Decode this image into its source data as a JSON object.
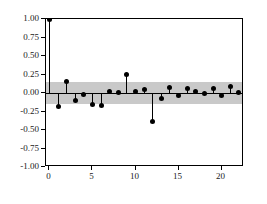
{
  "chart_data": {
    "type": "bar",
    "subtype": "stem-acf",
    "title": "",
    "subtitle": "",
    "xlabel": "",
    "ylabel": "",
    "x": [
      0,
      1,
      2,
      3,
      4,
      5,
      6,
      7,
      8,
      9,
      10,
      11,
      12,
      13,
      14,
      15,
      16,
      17,
      18,
      19,
      20,
      21,
      22
    ],
    "values": [
      1.0,
      -0.18,
      0.16,
      -0.1,
      -0.02,
      -0.15,
      -0.17,
      0.02,
      0.01,
      0.25,
      0.02,
      0.05,
      -0.39,
      -0.08,
      0.07,
      -0.03,
      0.06,
      0.02,
      -0.01,
      0.06,
      -0.04,
      0.09,
      0.01
    ],
    "categories": [
      "0",
      "1",
      "2",
      "3",
      "4",
      "5",
      "6",
      "7",
      "8",
      "9",
      "10",
      "11",
      "12",
      "13",
      "14",
      "15",
      "16",
      "17",
      "18",
      "19",
      "20",
      "21",
      "22"
    ],
    "series": [
      {
        "name": "autocorrelation",
        "values": [
          1.0,
          -0.18,
          0.16,
          -0.1,
          -0.02,
          -0.15,
          -0.17,
          0.02,
          0.01,
          0.25,
          0.02,
          0.05,
          -0.39,
          -0.08,
          0.07,
          -0.03,
          0.06,
          0.02,
          -0.01,
          0.06,
          -0.04,
          0.09,
          0.01
        ]
      }
    ],
    "xlim": [
      -0.4,
      22.6
    ],
    "ylim": [
      -1.0,
      1.0
    ],
    "yticks": [
      1.0,
      0.75,
      0.5,
      0.25,
      0.0,
      -0.25,
      -0.5,
      -0.75,
      -1.0
    ],
    "ytick_labels": [
      "1.00",
      "0.75",
      "0.50",
      "0.25",
      "0.00",
      "-0.25",
      "-0.50",
      "-0.75",
      "-1.00"
    ],
    "xticks": [
      0,
      5,
      10,
      15,
      20
    ],
    "xtick_labels": [
      "0",
      "5",
      "10",
      "15",
      "20"
    ],
    "grid": false,
    "legend": false,
    "legend_position": "none",
    "confidence_band": {
      "label": "significance band",
      "upper": 0.15,
      "lower": -0.15,
      "color": "#c9c9c9"
    },
    "zero_line_color": "#000000",
    "marker_color": "#000000",
    "stem_color": "#000000",
    "plot_border_color": "#000000",
    "background_color": "#ffffff"
  }
}
